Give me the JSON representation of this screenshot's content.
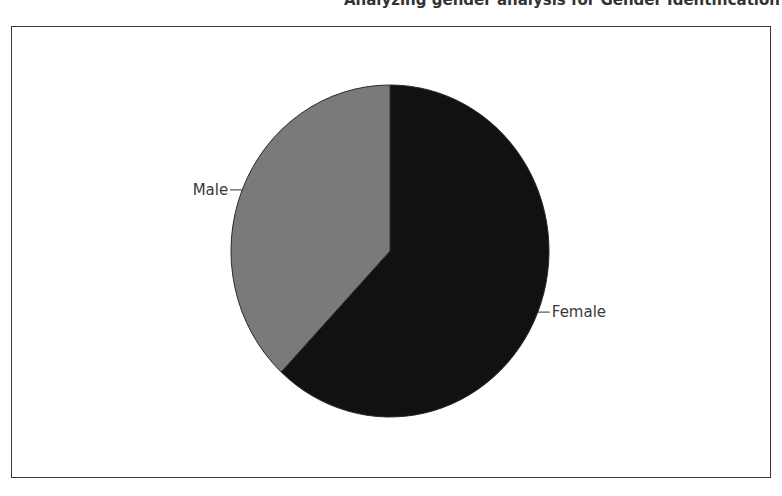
{
  "caption": "Analyzing gender analysis for Gender Identification",
  "chart_data": {
    "type": "pie",
    "title": "",
    "categories": [
      "Female",
      "Male"
    ],
    "values": [
      62,
      38
    ],
    "colors": [
      "#111111",
      "#7a7a7a"
    ],
    "start_angle_deg": 0,
    "direction": "clockwise",
    "legend": "none",
    "labels": [
      "Female",
      "Male"
    ]
  }
}
